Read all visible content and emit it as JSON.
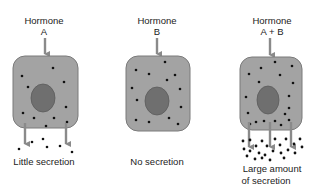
{
  "figure": {
    "panels": [
      {
        "hormone_label": "Hormone",
        "hormone_name": "A",
        "result_lines": [
          "Little secretion"
        ],
        "outflow_arrows": 2,
        "secretion_amount": "little"
      },
      {
        "hormone_label": "Hormone",
        "hormone_name": "B",
        "result_lines": [
          "No secretion"
        ],
        "outflow_arrows": 0,
        "secretion_amount": "none"
      },
      {
        "hormone_label": "Hormone",
        "hormone_name": "A + B",
        "result_lines": [
          "Large amount",
          "of secretion"
        ],
        "outflow_arrows": 3,
        "secretion_amount": "large"
      }
    ],
    "colors": {
      "cell_fill": "#a3a3a3",
      "cell_stroke": "#7a7a7a",
      "nucleus_fill": "#6f6f6f",
      "arrow": "#8a8a8a",
      "granule": "#111111"
    }
  }
}
